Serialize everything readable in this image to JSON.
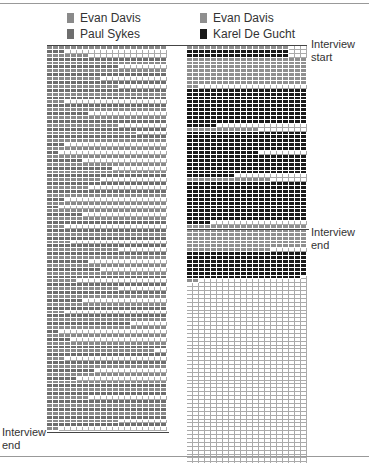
{
  "colors": {
    "evan_left": "#8a8a8a",
    "paul": "#6e6e6e",
    "evan_right": "#8f8f8f",
    "karel": "#1a1a1a",
    "empty": "#ffffff",
    "gridline": "#aaaaaa"
  },
  "chart_data": [
    {
      "type": "waffle",
      "title": "",
      "legend": [
        "Evan Davis",
        "Paul Sykes"
      ],
      "columns": 20,
      "rows": 99,
      "annotations": {
        "end": "Interview end"
      },
      "description": "Each row is a time step; filled cells = speaking share, grey = Evan Davis, dark grey = Paul Sykes",
      "row_fill": [
        20,
        3,
        7,
        20,
        20,
        12,
        20,
        20,
        9,
        20,
        12,
        20,
        20,
        20,
        3,
        20,
        20,
        7,
        20,
        20,
        12,
        20,
        15,
        20,
        20,
        3,
        20,
        2,
        20,
        6,
        20,
        11,
        20,
        20,
        9,
        20,
        7,
        20,
        20,
        3,
        20,
        2,
        20,
        6,
        20,
        20,
        3,
        20,
        20,
        20,
        4,
        20,
        12,
        20,
        20,
        7,
        20,
        9,
        20,
        20,
        5,
        20,
        12,
        20,
        20,
        6,
        20,
        20,
        3,
        20,
        20,
        14,
        20,
        2,
        20,
        4,
        20,
        20,
        18,
        20,
        3,
        20,
        20,
        8,
        20,
        5,
        20,
        20,
        20,
        20,
        7,
        20,
        20,
        20,
        20,
        20,
        12,
        20,
        2
      ]
    },
    {
      "type": "waffle",
      "title": "",
      "legend": [
        "Evan Davis",
        "Karel De Gucht"
      ],
      "columns": 20,
      "rows": 99,
      "annotations": {
        "start": "Interview start",
        "end": "Interview end"
      },
      "segments": [
        {
          "speaker": "Evan Davis",
          "rows": 1,
          "fill": 17
        },
        {
          "speaker": "Karel De Gucht",
          "rows": 2,
          "fill": 17
        },
        {
          "speaker": "Evan Davis",
          "rows": 7,
          "fill": 20
        },
        {
          "speaker": "Evan Davis",
          "rows": 1,
          "fill": 2
        },
        {
          "speaker": "Karel De Gucht",
          "rows": 9,
          "fill": 20
        },
        {
          "speaker": "Karel De Gucht",
          "rows": 1,
          "fill": 5
        },
        {
          "speaker": "Evan Davis",
          "rows": 1,
          "fill": 12
        },
        {
          "speaker": "Karel De Gucht",
          "rows": 5,
          "fill": 20
        },
        {
          "speaker": "Karel De Gucht",
          "rows": 1,
          "fill": 12
        },
        {
          "speaker": "Karel De Gucht",
          "rows": 5,
          "fill": 20
        },
        {
          "speaker": "Karel De Gucht",
          "rows": 1,
          "fill": 8
        },
        {
          "speaker": "Evan Davis",
          "rows": 1,
          "fill": 14
        },
        {
          "speaker": "Karel De Gucht",
          "rows": 10,
          "fill": 20
        },
        {
          "speaker": "Karel De Gucht",
          "rows": 1,
          "fill": 4
        },
        {
          "speaker": "Evan Davis",
          "rows": 6,
          "fill": 20
        },
        {
          "speaker": "Evan Davis",
          "rows": 1,
          "fill": 14
        },
        {
          "speaker": "Karel De Gucht",
          "rows": 6,
          "fill": 20
        },
        {
          "speaker": "Karel De Gucht",
          "rows": 1,
          "fill": 19
        },
        {
          "speaker": "Evan Davis",
          "rows": 1,
          "fill": 2
        },
        {
          "speaker": "empty",
          "rows": 47,
          "fill": 0
        }
      ]
    }
  ],
  "legend_left": {
    "a": "Evan Davis",
    "b": "Paul Sykes"
  },
  "legend_right": {
    "a": "Evan Davis",
    "b": "Karel De Gucht"
  },
  "labels": {
    "start_line1": "Interview",
    "start_line2": "start",
    "end_right_line1": "Interview",
    "end_right_line2": "end",
    "end_left_line1": "Interview",
    "end_left_line2": "end"
  }
}
